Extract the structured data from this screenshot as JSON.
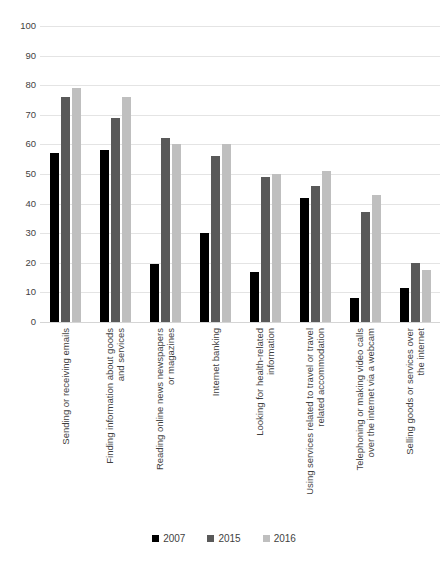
{
  "chart_data": {
    "type": "bar",
    "title": "",
    "subtitle": "",
    "xlabel": "",
    "ylabel": "",
    "ylim": [
      0,
      100
    ],
    "ytick_step": 10,
    "yticks": [
      100,
      90,
      80,
      70,
      60,
      50,
      40,
      30,
      20,
      10,
      0
    ],
    "grid": true,
    "legend_position": "bottom-center",
    "categories": [
      "Sending or receiving emails",
      "Finding information about goods and services",
      "Reading online news newspapers or magazines",
      "Internet banking",
      "Looking for health-related information",
      "Using services related to travel or travel related accommodation",
      "Telephoning or making video calls over the internet via a webcam",
      "Selling goods or services over the internet"
    ],
    "category_lines": [
      [
        "Sending or receiving emails"
      ],
      [
        "Finding information about goods",
        "and services"
      ],
      [
        "Reading online news newspapers",
        "or magazines"
      ],
      [
        "Internet banking"
      ],
      [
        "Looking for health-related",
        "information"
      ],
      [
        "Using services related to travel or travel",
        "related accommodation"
      ],
      [
        "Telephoning or making video calls",
        "over the internet via a webcam"
      ],
      [
        "Selling goods or services over",
        "the internet"
      ]
    ],
    "series": [
      {
        "name": "2007",
        "color": "#000000",
        "values": [
          57,
          58,
          19.5,
          30,
          17,
          42,
          8,
          11.5
        ]
      },
      {
        "name": "2015",
        "color": "#595959",
        "values": [
          76,
          69,
          62,
          56,
          49,
          46,
          37,
          20
        ]
      },
      {
        "name": "2016",
        "color": "#bfbfbf",
        "values": [
          79,
          76,
          60,
          60,
          50,
          51,
          43,
          17.5
        ]
      }
    ]
  },
  "legend": {
    "items": [
      {
        "label": "2007",
        "color": "#000000"
      },
      {
        "label": "2015",
        "color": "#595959"
      },
      {
        "label": "2016",
        "color": "#bfbfbf"
      }
    ]
  }
}
